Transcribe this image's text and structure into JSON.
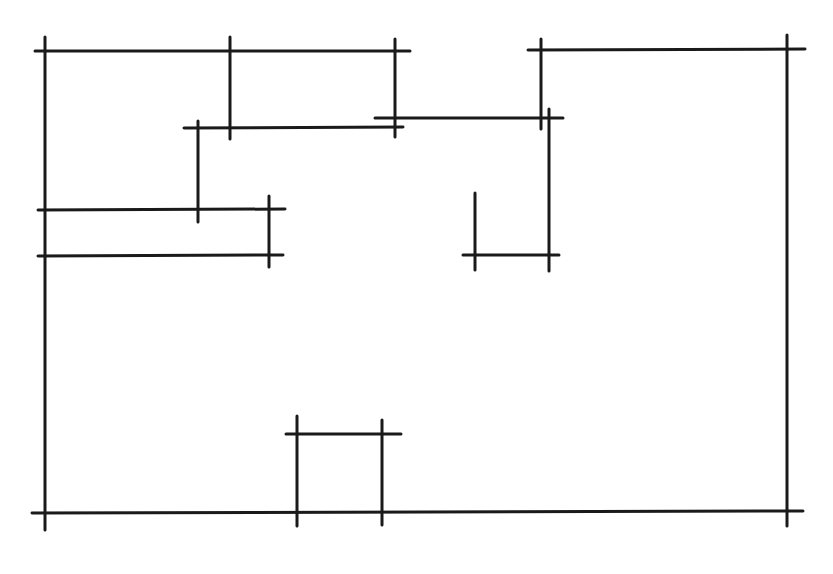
{
  "diagram": {
    "type": "line-drawing",
    "stroke_color": "#1a1a1a",
    "background_color": "#ffffff",
    "stroke_width": 3,
    "horizontal_segments": [
      {
        "id": "h-top-left",
        "x1": 35,
        "y1": 51,
        "x2": 410,
        "y2": 51
      },
      {
        "id": "h-top-right",
        "x1": 528,
        "y1": 50,
        "x2": 805,
        "y2": 49
      },
      {
        "id": "h-upper-mid-left",
        "x1": 184,
        "y1": 128,
        "x2": 403,
        "y2": 127
      },
      {
        "id": "h-upper-mid-right",
        "x1": 375,
        "y1": 118,
        "x2": 563,
        "y2": 118
      },
      {
        "id": "h-left-1",
        "x1": 38,
        "y1": 210,
        "x2": 285,
        "y2": 209
      },
      {
        "id": "h-left-2",
        "x1": 38,
        "y1": 256,
        "x2": 283,
        "y2": 255
      },
      {
        "id": "h-right-small",
        "x1": 463,
        "y1": 255,
        "x2": 559,
        "y2": 255
      },
      {
        "id": "h-bottom-box",
        "x1": 286,
        "y1": 434,
        "x2": 401,
        "y2": 434
      },
      {
        "id": "h-bottom",
        "x1": 32,
        "y1": 513,
        "x2": 803,
        "y2": 511
      }
    ],
    "vertical_segments": [
      {
        "id": "v-left-border",
        "x1": 45,
        "y1": 37,
        "x2": 45,
        "y2": 530
      },
      {
        "id": "v-top-1",
        "x1": 230,
        "y1": 37,
        "x2": 230,
        "y2": 139
      },
      {
        "id": "v-top-2",
        "x1": 395,
        "y1": 39,
        "x2": 395,
        "y2": 137
      },
      {
        "id": "v-mid-left",
        "x1": 198,
        "y1": 121,
        "x2": 198,
        "y2": 222
      },
      {
        "id": "v-left-short",
        "x1": 269,
        "y1": 196,
        "x2": 269,
        "y2": 267
      },
      {
        "id": "v-top-right-1",
        "x1": 541,
        "y1": 39,
        "x2": 541,
        "y2": 129
      },
      {
        "id": "v-right-mid",
        "x1": 549,
        "y1": 109,
        "x2": 549,
        "y2": 271
      },
      {
        "id": "v-right-short",
        "x1": 475,
        "y1": 193,
        "x2": 475,
        "y2": 270
      },
      {
        "id": "v-right-border",
        "x1": 787,
        "y1": 35,
        "x2": 787,
        "y2": 526
      },
      {
        "id": "v-bottom-box-1",
        "x1": 297,
        "y1": 416,
        "x2": 297,
        "y2": 526
      },
      {
        "id": "v-bottom-box-2",
        "x1": 382,
        "y1": 420,
        "x2": 382,
        "y2": 525
      }
    ]
  }
}
